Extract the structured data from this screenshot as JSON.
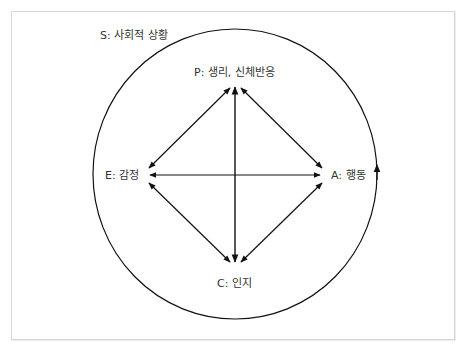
{
  "diagram": {
    "type": "cycle-with-cross-links",
    "context": {
      "id": "S",
      "label": "S: 사회적 상황",
      "shape": "circle",
      "direction_arrow": "upward on right side (clockwise flow)"
    },
    "nodes": [
      {
        "id": "P",
        "label": "P: 생리, 신체반응",
        "position": "top"
      },
      {
        "id": "E",
        "label": "E: 감정",
        "position": "left"
      },
      {
        "id": "A",
        "label": "A: 행동",
        "position": "right"
      },
      {
        "id": "C",
        "label": "C: 인지",
        "position": "bottom"
      }
    ],
    "edges": [
      {
        "from": "P",
        "to": "E",
        "bidirectional": true
      },
      {
        "from": "P",
        "to": "A",
        "bidirectional": true
      },
      {
        "from": "P",
        "to": "C",
        "bidirectional": true
      },
      {
        "from": "E",
        "to": "A",
        "bidirectional": true
      },
      {
        "from": "E",
        "to": "C",
        "bidirectional": true
      },
      {
        "from": "A",
        "to": "C",
        "bidirectional": true
      }
    ]
  },
  "colors": {
    "line": "#111111",
    "text": "#333333",
    "frame": "#d6d6d6",
    "background": "#ffffff"
  }
}
